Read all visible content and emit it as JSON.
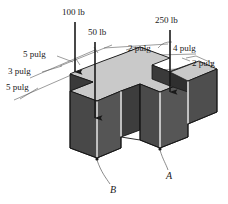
{
  "figure": {
    "units": "pulg",
    "colors": {
      "background": "#ffffff",
      "top_face": "#c9c9c9",
      "front_face_dark": "#4a4a4a",
      "side_face": "#3f3f3f",
      "notch_shadow": "#2e2e2e",
      "edge_highlight": "#f2f2f2",
      "line": "#1a1a1a",
      "dimension_line": "#555555"
    }
  },
  "loads": [
    {
      "name": "load-100lb",
      "label": "100 lb",
      "magnitude": 100,
      "unit": "lb",
      "direction": "down"
    },
    {
      "name": "load-50lb",
      "label": "50 lb",
      "magnitude": 50,
      "unit": "lb",
      "direction": "down"
    },
    {
      "name": "load-250lb",
      "label": "250 lb",
      "magnitude": 250,
      "unit": "lb",
      "direction": "down"
    }
  ],
  "dimensions": [
    {
      "name": "dim-5-pulg-top-left",
      "label": "5 pulg",
      "value": 5,
      "unit": "pulg"
    },
    {
      "name": "dim-3-pulg",
      "label": "3 pulg",
      "value": 3,
      "unit": "pulg"
    },
    {
      "name": "dim-5-pulg-lower-left",
      "label": "5 pulg",
      "value": 5,
      "unit": "pulg"
    },
    {
      "name": "dim-2-pulg-top",
      "label": "2 pulg",
      "value": 2,
      "unit": "pulg"
    },
    {
      "name": "dim-4-pulg",
      "label": "4 pulg",
      "value": 4,
      "unit": "pulg"
    },
    {
      "name": "dim-2-pulg-right",
      "label": "2 pulg",
      "value": 2,
      "unit": "pulg"
    }
  ],
  "points": [
    {
      "name": "point-a",
      "label": "A"
    },
    {
      "name": "point-b",
      "label": "B"
    }
  ]
}
